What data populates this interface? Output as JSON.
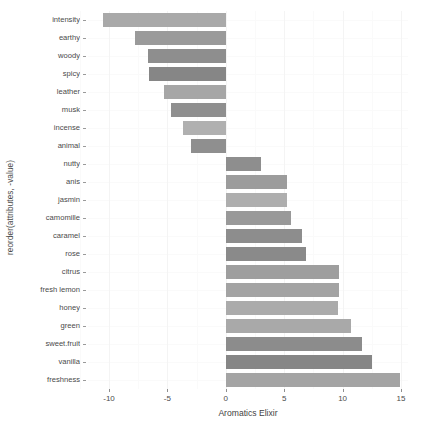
{
  "chart_data": {
    "type": "bar",
    "orientation": "horizontal",
    "title": "",
    "xlabel": "Aromatics Elixir",
    "ylabel": "reorder(attributes, -value)",
    "xlim": [
      -11.8,
      15.6
    ],
    "xticks": [
      -10,
      -5,
      0,
      5,
      10,
      15
    ],
    "xtick_labels": [
      "-10",
      "-5",
      "0",
      "5",
      "10",
      "15"
    ],
    "grid": true,
    "legend": "none",
    "categories": [
      "intensity",
      "earthy",
      "woody",
      "spicy",
      "leather",
      "musk",
      "incense",
      "animal",
      "nutty",
      "anis",
      "jasmin",
      "camomille",
      "caramel",
      "rose",
      "citrus",
      "fresh lemon",
      "honey",
      "green",
      "sweet.fruit",
      "vanilla",
      "freshness"
    ],
    "values": [
      -10.5,
      -7.8,
      -6.7,
      -6.6,
      -5.3,
      -4.7,
      -3.7,
      -3.0,
      3.0,
      5.2,
      5.2,
      5.6,
      6.5,
      6.9,
      9.7,
      9.7,
      9.6,
      10.7,
      11.7,
      12.5,
      14.9
    ],
    "bar_colors": [
      "#a9a9a9",
      "#9a9a9a",
      "#8e8e8e",
      "#868686",
      "#a6a6a6",
      "#8f8f8f",
      "#b0b0b0",
      "#8f8f8f",
      "#8e8e8e",
      "#9c9c9c",
      "#aeaeae",
      "#999999",
      "#8d8d8d",
      "#8a8a8a",
      "#9e9e9e",
      "#a3a3a3",
      "#ababab",
      "#a9a9a9",
      "#8c8c8c",
      "#868686",
      "#a4a4a4"
    ]
  },
  "axes": {
    "x_title": "Aromatics Elixir",
    "y_title": "reorder(attributes, -value)"
  }
}
